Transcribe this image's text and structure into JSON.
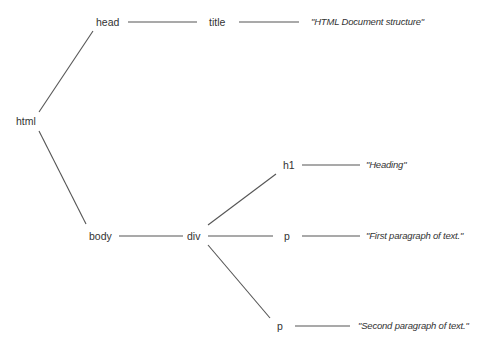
{
  "diagram": {
    "type": "tree",
    "nodes": {
      "html": "html",
      "head": "head",
      "title": "title",
      "body": "body",
      "div": "div",
      "h1": "h1",
      "p1": "p",
      "p2": "p"
    },
    "leaves": {
      "title_text": "\"HTML Document structure\"",
      "h1_text": "\"Heading\"",
      "p1_text": "\"First paragraph of text.\"",
      "p2_text": "\"Second paragraph of text.\""
    },
    "edges": [
      [
        "html",
        "head"
      ],
      [
        "html",
        "body"
      ],
      [
        "head",
        "title"
      ],
      [
        "title",
        "title_text"
      ],
      [
        "body",
        "div"
      ],
      [
        "div",
        "h1"
      ],
      [
        "div",
        "p1"
      ],
      [
        "div",
        "p2"
      ],
      [
        "h1",
        "h1_text"
      ],
      [
        "p1",
        "p1_text"
      ],
      [
        "p2",
        "p2_text"
      ]
    ],
    "line_color": "#555555",
    "text_color": "#333333"
  }
}
